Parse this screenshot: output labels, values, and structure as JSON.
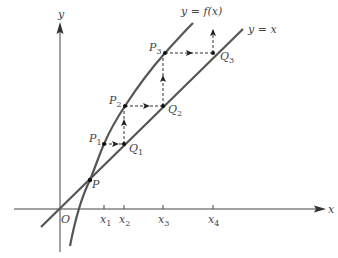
{
  "diagram": {
    "axes": {
      "x_label": "x",
      "y_label": "y",
      "origin_label": "O"
    },
    "curves": {
      "f_label": "y = f(x)",
      "identity_label": "y = x"
    },
    "points": {
      "P": {
        "label": "P",
        "sub": ""
      },
      "P1": {
        "label": "P",
        "sub": "1"
      },
      "P2": {
        "label": "P",
        "sub": "2"
      },
      "P3": {
        "label": "P",
        "sub": "3"
      },
      "Q1": {
        "label": "Q",
        "sub": "1"
      },
      "Q2": {
        "label": "Q",
        "sub": "2"
      },
      "Q3": {
        "label": "Q",
        "sub": "3"
      }
    },
    "ticks": [
      {
        "label": "x",
        "sub": "1"
      },
      {
        "label": "x",
        "sub": "2"
      },
      {
        "label": "x",
        "sub": "3"
      },
      {
        "label": "x",
        "sub": "4"
      }
    ],
    "colors": {
      "curve": "#555555",
      "axis": "#444444",
      "dash": "#333333",
      "text": "#444444"
    }
  }
}
